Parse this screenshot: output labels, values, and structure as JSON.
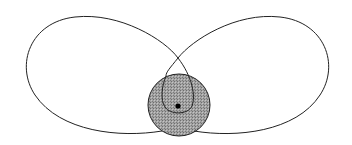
{
  "diagram": {
    "type": "orbit-lobes",
    "colors": {
      "background": "#ffffff",
      "stroke": "#222222",
      "shaded_fill": "#9a9a9a",
      "hatch_dark": "#6e6e6e",
      "hatch_light": "#bdbdbd",
      "dot": "#000000"
    },
    "elements": {
      "left_lobe": {
        "label": ""
      },
      "right_lobe": {
        "label": ""
      },
      "central_body": {
        "cx": 179,
        "cy": 105,
        "r": 31,
        "label": ""
      },
      "center_dot": {
        "cx": 178,
        "cy": 106,
        "r": 2.6,
        "label": ""
      }
    }
  }
}
